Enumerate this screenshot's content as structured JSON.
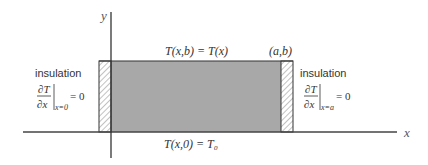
{
  "axes": {
    "x_label": "x",
    "y_label": "y"
  },
  "boundaries": {
    "top": "T(x,b) = T(x)",
    "bottom": "T(x,0) = T₀",
    "corner": "(a,b)",
    "left": {
      "label": "insulation",
      "numerator": "∂T",
      "denominator": "∂x",
      "subscript": "x=0",
      "rhs": "= 0"
    },
    "right": {
      "label": "insulation",
      "numerator": "∂T",
      "denominator": "∂x",
      "subscript": "x=a",
      "rhs": "= 0"
    }
  },
  "colors": {
    "domain_fill": "#a8a8a8",
    "line": "#333333",
    "text": "#333333"
  }
}
